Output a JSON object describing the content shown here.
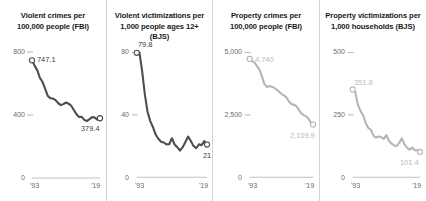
{
  "figure": {
    "panel_divider_color": "#d2d2d2",
    "line_color_dark": "#4d4d4d",
    "line_color_light": "#b5b5b5",
    "axis_color": "#b0b0b0",
    "tick_text_color": "#6a6a6a"
  },
  "chart_data": [
    {
      "type": "line",
      "title": "Violent crimes per\n100,000 people (FBI)",
      "xlabel": "",
      "ylabel": "",
      "xlim": [
        1993,
        2019
      ],
      "ylim": [
        0,
        800
      ],
      "grid": false,
      "legend": "none",
      "ytick_labels": [
        "800",
        "400",
        "0"
      ],
      "ytick_values": [
        800,
        400,
        0
      ],
      "xtick_labels": [
        "'93",
        "'19"
      ],
      "xtick_values": [
        1993,
        2019
      ],
      "series_color": "#4d4d4d",
      "endpoint_labels": [
        {
          "text": "747.1",
          "x": 1993,
          "y": 747.1
        },
        {
          "text": "379.4",
          "x": 2019,
          "y": 379.4
        }
      ],
      "x": [
        1993,
        1994,
        1995,
        1996,
        1997,
        1998,
        1999,
        2000,
        2001,
        2002,
        2003,
        2004,
        2005,
        2006,
        2007,
        2008,
        2009,
        2010,
        2011,
        2012,
        2013,
        2014,
        2015,
        2016,
        2017,
        2018,
        2019
      ],
      "values": [
        747.1,
        713.6,
        684.5,
        636.6,
        611.0,
        567.6,
        523.0,
        506.5,
        504.5,
        494.4,
        475.8,
        463.2,
        469.0,
        479.3,
        471.8,
        458.6,
        431.9,
        404.5,
        387.1,
        387.8,
        369.1,
        361.6,
        373.7,
        386.6,
        383.8,
        370.8,
        379.4
      ]
    },
    {
      "type": "line",
      "title": "Violent victimizations per\n1,000 people ages 12+ (BJS)",
      "xlabel": "",
      "ylabel": "",
      "xlim": [
        1993,
        2019
      ],
      "ylim": [
        0,
        80
      ],
      "grid": false,
      "legend": "none",
      "ytick_labels": [
        "80",
        "40",
        "0"
      ],
      "ytick_values": [
        80,
        40,
        0
      ],
      "xtick_labels": [
        "'93",
        "'19"
      ],
      "xtick_values": [
        1993,
        2019
      ],
      "series_color": "#4d4d4d",
      "endpoint_labels": [
        {
          "text": "79.8",
          "x": 1993,
          "y": 79.8
        },
        {
          "text": "21",
          "x": 2019,
          "y": 21.0
        }
      ],
      "x": [
        1993,
        1994,
        1995,
        1996,
        1997,
        1998,
        1999,
        2000,
        2001,
        2002,
        2003,
        2004,
        2005,
        2006,
        2007,
        2008,
        2009,
        2010,
        2011,
        2012,
        2013,
        2014,
        2015,
        2016,
        2017,
        2018,
        2019
      ],
      "values": [
        79.8,
        80.0,
        68.2,
        53.1,
        42.0,
        36.0,
        32.1,
        27.4,
        24.7,
        22.8,
        22.3,
        21.1,
        21.2,
        25.0,
        21.0,
        19.3,
        17.1,
        19.3,
        22.6,
        26.1,
        23.2,
        20.1,
        18.6,
        21.1,
        20.6,
        23.2,
        21.0
      ]
    },
    {
      "type": "line",
      "title": "Property crimes per\n100,000 people (FBI)",
      "xlabel": "",
      "ylabel": "",
      "xlim": [
        1993,
        2019
      ],
      "ylim": [
        0,
        5000
      ],
      "grid": false,
      "legend": "none",
      "ytick_labels": [
        "5,000",
        "2,500",
        "0"
      ],
      "ytick_values": [
        5000,
        2500,
        0
      ],
      "xtick_labels": [
        "'93",
        "'19"
      ],
      "xtick_values": [
        1993,
        2019
      ],
      "series_color": "#b5b5b5",
      "endpoint_labels": [
        {
          "text": "4,740",
          "x": 1993,
          "y": 4740.0
        },
        {
          "text": "2,109.9",
          "x": 2019,
          "y": 2109.9
        }
      ],
      "x": [
        1993,
        1994,
        1995,
        1996,
        1997,
        1998,
        1999,
        2000,
        2001,
        2002,
        2003,
        2004,
        2005,
        2006,
        2007,
        2008,
        2009,
        2010,
        2011,
        2012,
        2013,
        2014,
        2015,
        2016,
        2017,
        2018,
        2019
      ],
      "values": [
        4740.0,
        4660.2,
        4590.5,
        4451.0,
        4316.3,
        4052.5,
        3743.6,
        3618.3,
        3658.1,
        3630.6,
        3591.2,
        3514.1,
        3431.5,
        3346.6,
        3276.4,
        3214.6,
        3041.3,
        2945.9,
        2905.4,
        2868.0,
        2733.6,
        2574.1,
        2500.5,
        2451.6,
        2362.2,
        2209.8,
        2109.9
      ]
    },
    {
      "type": "line",
      "title": "Property victimizations per\n1,000 households (BJS)",
      "xlabel": "",
      "ylabel": "",
      "xlim": [
        1993,
        2019
      ],
      "ylim": [
        0,
        500
      ],
      "grid": false,
      "legend": "none",
      "ytick_labels": [
        "500",
        "250",
        "0"
      ],
      "ytick_values": [
        500,
        250,
        0
      ],
      "xtick_labels": [
        "'93",
        "'19"
      ],
      "xtick_values": [
        1993,
        2019
      ],
      "series_color": "#b5b5b5",
      "endpoint_labels": [
        {
          "text": "351.8",
          "x": 1993,
          "y": 351.8
        },
        {
          "text": "101.4",
          "x": 2019,
          "y": 101.4
        }
      ],
      "x": [
        1993,
        1994,
        1995,
        1996,
        1997,
        1998,
        1999,
        2000,
        2001,
        2002,
        2003,
        2004,
        2005,
        2006,
        2007,
        2008,
        2009,
        2010,
        2011,
        2012,
        2013,
        2014,
        2015,
        2016,
        2017,
        2018,
        2019
      ],
      "values": [
        351.8,
        341.2,
        290.5,
        266.3,
        248.3,
        217.4,
        198.0,
        190.4,
        166.9,
        159.0,
        163.2,
        161.1,
        154.0,
        169.0,
        146.5,
        134.7,
        127.4,
        125.4,
        138.7,
        155.8,
        131.4,
        118.1,
        110.7,
        118.6,
        108.4,
        108.2,
        101.4
      ]
    }
  ]
}
